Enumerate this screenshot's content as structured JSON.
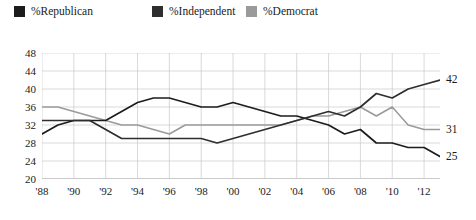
{
  "legend": {
    "items": [
      {
        "label": "%Republican",
        "color": "#1c1c1c",
        "icon": "square-swatch-icon"
      },
      {
        "label": "%Independent",
        "color": "#2e2e2e",
        "icon": "square-swatch-icon"
      },
      {
        "label": "%Democrat",
        "color": "#9a9a9a",
        "icon": "square-swatch-icon"
      }
    ]
  },
  "end_labels": [
    {
      "text": "42",
      "series": "%Independent"
    },
    {
      "text": "31",
      "series": "%Democrat"
    },
    {
      "text": "25",
      "series": "%Republican"
    }
  ],
  "chart_data": {
    "type": "line",
    "title": "",
    "xlabel": "",
    "ylabel": "",
    "ylim": [
      20,
      48
    ],
    "xlim": [
      1988,
      2013
    ],
    "grid": true,
    "legend_position": "top-left",
    "yticks": [
      20,
      24,
      28,
      32,
      36,
      40,
      44,
      48
    ],
    "xticks": [
      1988,
      1990,
      1992,
      1994,
      1996,
      1998,
      2000,
      2002,
      2004,
      2006,
      2008,
      2010,
      2012
    ],
    "xticklabels": [
      "'88",
      "'90",
      "'92",
      "'94",
      "'96",
      "'98",
      "'00",
      "'02",
      "'04",
      "'06",
      "'08",
      "'10",
      "'12"
    ],
    "x": [
      1988,
      1989,
      1990,
      1991,
      1992,
      1993,
      1994,
      1995,
      1996,
      1997,
      1998,
      1999,
      2000,
      2001,
      2002,
      2003,
      2004,
      2005,
      2006,
      2007,
      2008,
      2009,
      2010,
      2011,
      2012,
      2013
    ],
    "series": [
      {
        "name": "%Republican",
        "color": "#1c1c1c",
        "values": [
          30,
          32,
          33,
          33,
          33,
          35,
          37,
          38,
          38,
          37,
          36,
          36,
          37,
          36,
          35,
          34,
          34,
          33,
          32,
          30,
          31,
          28,
          28,
          27,
          27,
          25
        ]
      },
      {
        "name": "%Independent",
        "color": "#2e2e2e",
        "values": [
          33,
          33,
          33,
          33,
          31,
          29,
          29,
          29,
          29,
          29,
          29,
          28,
          29,
          30,
          31,
          32,
          33,
          34,
          35,
          34,
          36,
          39,
          38,
          40,
          41,
          42
        ]
      },
      {
        "name": "%Democrat",
        "color": "#9a9a9a",
        "values": [
          36,
          36,
          35,
          34,
          33,
          32,
          32,
          31,
          30,
          32,
          32,
          32,
          32,
          32,
          32,
          32,
          33,
          34,
          34,
          35,
          36,
          34,
          36,
          32,
          31,
          31
        ]
      }
    ]
  }
}
